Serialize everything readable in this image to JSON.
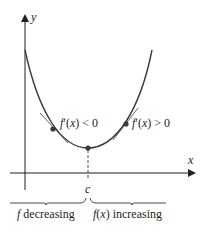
{
  "diagram": {
    "type": "function-graph",
    "axes": {
      "x_label": "x",
      "y_label": "y"
    },
    "critical_point_label": "c",
    "annotations": {
      "left_derivative": "f′(x) < 0",
      "right_derivative": "f′(x) > 0"
    },
    "intervals": {
      "left": "f decreasing",
      "right": "f(x) increasing"
    },
    "colors": {
      "curve": "#3a3a3c",
      "axes": "#231f20",
      "points": "#3a3a3c"
    }
  }
}
